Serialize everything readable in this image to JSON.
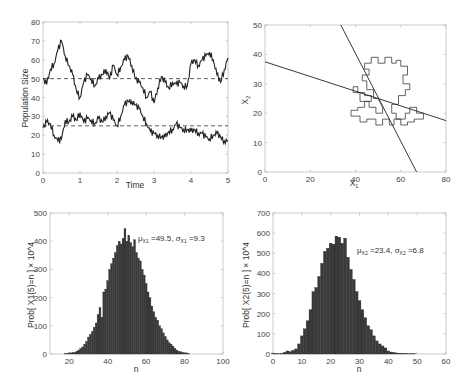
{
  "chart_data": [
    {
      "type": "line",
      "panel": "top-left",
      "title": "",
      "xlabel": "Time",
      "ylabel": "Population Size",
      "xlim": [
        0,
        5
      ],
      "ylim": [
        0,
        80
      ],
      "xticks": [
        "0",
        "1",
        "2",
        "3",
        "4",
        "5"
      ],
      "yticks": [
        "0",
        "10",
        "20",
        "30",
        "40",
        "50",
        "60",
        "70",
        "80"
      ],
      "series": [
        {
          "name": "X1 trajectory",
          "style": "solid",
          "x": [
            0,
            0.1,
            0.2,
            0.3,
            0.4,
            0.5,
            0.6,
            0.7,
            0.8,
            0.9,
            1.0,
            1.1,
            1.2,
            1.3,
            1.4,
            1.5,
            1.6,
            1.7,
            1.8,
            1.9,
            2.0,
            2.1,
            2.2,
            2.3,
            2.4,
            2.5,
            2.6,
            2.7,
            2.8,
            2.9,
            3.0,
            3.1,
            3.2,
            3.3,
            3.4,
            3.5,
            3.6,
            3.7,
            3.8,
            3.9,
            4.0,
            4.1,
            4.2,
            4.3,
            4.4,
            4.5,
            4.6,
            4.7,
            4.8,
            4.9,
            5.0
          ],
          "values": [
            50,
            47,
            55,
            58,
            65,
            70,
            62,
            57,
            52,
            44,
            40,
            48,
            52,
            50,
            46,
            50,
            52,
            55,
            50,
            57,
            52,
            56,
            60,
            62,
            57,
            50,
            48,
            45,
            40,
            43,
            37,
            45,
            51,
            48,
            45,
            48,
            47,
            48,
            46,
            46,
            58,
            60,
            57,
            60,
            62,
            64,
            60,
            52,
            48,
            55,
            61
          ]
        },
        {
          "name": "X2 trajectory",
          "style": "solid",
          "x": [
            0,
            0.1,
            0.2,
            0.3,
            0.4,
            0.5,
            0.6,
            0.7,
            0.8,
            0.9,
            1.0,
            1.1,
            1.2,
            1.3,
            1.4,
            1.5,
            1.6,
            1.7,
            1.8,
            1.9,
            2.0,
            2.1,
            2.2,
            2.3,
            2.4,
            2.5,
            2.6,
            2.7,
            2.8,
            2.9,
            3.0,
            3.1,
            3.2,
            3.3,
            3.4,
            3.5,
            3.6,
            3.7,
            3.8,
            3.9,
            4.0,
            4.1,
            4.2,
            4.3,
            4.4,
            4.5,
            4.6,
            4.7,
            4.8,
            4.9,
            5.0
          ],
          "values": [
            24,
            27,
            26,
            20,
            17,
            18,
            28,
            27,
            30,
            28,
            32,
            27,
            29,
            28,
            26,
            29,
            27,
            30,
            32,
            28,
            25,
            30,
            36,
            38,
            38,
            36,
            34,
            30,
            26,
            22,
            21,
            20,
            19,
            19,
            22,
            23,
            26,
            24,
            23,
            23,
            22,
            23,
            21,
            21,
            19,
            18,
            20,
            21,
            19,
            17,
            17
          ]
        },
        {
          "name": "X1 equilibrium",
          "style": "dashed",
          "x": [
            0,
            5
          ],
          "values": [
            50,
            50
          ]
        },
        {
          "name": "X2 equilibrium",
          "style": "dashed",
          "x": [
            0,
            5
          ],
          "values": [
            25,
            25
          ]
        }
      ]
    },
    {
      "type": "line",
      "panel": "top-right",
      "title": "",
      "xlabel": "X1",
      "ylabel": "X2",
      "xlim": [
        0,
        80
      ],
      "ylim": [
        0,
        50
      ],
      "xticks": [
        "0",
        "20",
        "40",
        "60",
        "80"
      ],
      "yticks": [
        "0",
        "10",
        "20",
        "30",
        "40",
        "50"
      ],
      "series": [
        {
          "name": "nullcline 1",
          "style": "solid",
          "x": [
            0,
            80
          ],
          "values": [
            37.5,
            17.5
          ]
        },
        {
          "name": "nullcline 2",
          "style": "solid",
          "x": [
            33.5,
            67
          ],
          "values": [
            50,
            0
          ]
        },
        {
          "name": "phase-plane random walk",
          "style": "staircase",
          "x": [
            50,
            48,
            48,
            45,
            45,
            43,
            43,
            46,
            46,
            44,
            44,
            47,
            47,
            50,
            50,
            53,
            53,
            56,
            56,
            58,
            58,
            60,
            60,
            63,
            63,
            61,
            61,
            64,
            64,
            62,
            62,
            59,
            59,
            56,
            56,
            58,
            58,
            62,
            62,
            64,
            64,
            67,
            67,
            70,
            70,
            66,
            66,
            63,
            63,
            60,
            60,
            57,
            57,
            55,
            55,
            52,
            52,
            49,
            49,
            45,
            45,
            42,
            42,
            38,
            38,
            41,
            41,
            44,
            44,
            47,
            47,
            44,
            44,
            41,
            41,
            39,
            39,
            42,
            42,
            46,
            46,
            49,
            49,
            52,
            52,
            50
          ],
          "values": [
            25,
            25,
            28,
            28,
            31,
            31,
            33,
            33,
            35,
            35,
            37,
            37,
            39,
            39,
            37,
            37,
            39,
            39,
            37,
            37,
            38,
            38,
            36,
            36,
            33,
            33,
            30,
            30,
            28,
            28,
            26,
            26,
            23,
            23,
            20,
            20,
            18,
            18,
            20,
            20,
            22,
            22,
            20,
            20,
            18,
            18,
            17,
            17,
            16,
            16,
            18,
            18,
            16,
            16,
            18,
            18,
            16,
            16,
            18,
            18,
            17,
            17,
            19,
            19,
            21,
            21,
            22,
            22,
            24,
            24,
            26,
            26,
            27,
            27,
            29,
            29,
            27,
            27,
            24,
            24,
            22,
            22,
            20,
            20,
            22,
            25
          ]
        }
      ]
    },
    {
      "type": "bar",
      "panel": "bottom-left",
      "title": "",
      "xlabel": "n",
      "ylabel": "Prob[ X1(5)=n ] × 10^4",
      "xlim": [
        10,
        100
      ],
      "ylim": [
        0,
        500
      ],
      "xticks": [
        "20",
        "40",
        "60",
        "80",
        "100"
      ],
      "yticks": [
        "0",
        "100",
        "200",
        "300",
        "400",
        "500"
      ],
      "annotation": "μX1=49.5, σX1=9.3",
      "categories": [
        18,
        20,
        22,
        24,
        25,
        26,
        27,
        28,
        29,
        30,
        31,
        32,
        33,
        34,
        35,
        36,
        37,
        38,
        39,
        40,
        41,
        42,
        43,
        44,
        45,
        46,
        47,
        48,
        49,
        50,
        51,
        52,
        53,
        54,
        55,
        56,
        57,
        58,
        59,
        60,
        61,
        62,
        63,
        64,
        65,
        66,
        67,
        68,
        69,
        70,
        71,
        72,
        73,
        74,
        75,
        76,
        77,
        78,
        79,
        80,
        82
      ],
      "values": [
        2,
        4,
        6,
        10,
        14,
        20,
        25,
        35,
        45,
        60,
        70,
        80,
        95,
        110,
        140,
        165,
        130,
        220,
        230,
        260,
        300,
        320,
        340,
        360,
        385,
        400,
        390,
        410,
        445,
        400,
        420,
        395,
        380,
        405,
        360,
        340,
        330,
        300,
        280,
        250,
        220,
        200,
        170,
        150,
        130,
        120,
        100,
        90,
        75,
        62,
        50,
        40,
        35,
        28,
        20,
        14,
        10,
        8,
        6,
        4,
        2
      ]
    },
    {
      "type": "bar",
      "panel": "bottom-right",
      "title": "",
      "xlabel": "n",
      "ylabel": "Prob[ X2(5)=n ] × 10^4",
      "xlim": [
        0,
        60
      ],
      "ylim": [
        0,
        700
      ],
      "xticks": [
        "0",
        "10",
        "20",
        "30",
        "40",
        "50",
        "60"
      ],
      "yticks": [
        "0",
        "100",
        "200",
        "300",
        "400",
        "500",
        "600",
        "700"
      ],
      "annotation": "μX2=23.4, σX2=6.8",
      "categories": [
        0,
        1,
        2,
        3,
        4,
        5,
        6,
        7,
        8,
        9,
        10,
        11,
        12,
        13,
        14,
        15,
        16,
        17,
        18,
        19,
        20,
        21,
        22,
        23,
        24,
        25,
        26,
        27,
        28,
        29,
        30,
        31,
        32,
        33,
        34,
        35,
        36,
        37,
        38,
        39,
        40,
        41,
        42,
        43,
        44,
        45,
        46,
        47,
        48,
        49,
        50
      ],
      "values": [
        3,
        2,
        1,
        3,
        8,
        15,
        12,
        18,
        25,
        50,
        90,
        125,
        165,
        220,
        310,
        330,
        385,
        450,
        510,
        525,
        550,
        545,
        585,
        580,
        550,
        575,
        480,
        420,
        370,
        310,
        265,
        220,
        180,
        140,
        120,
        90,
        65,
        50,
        40,
        30,
        15,
        10,
        8,
        5,
        4,
        3,
        2,
        1,
        1,
        1,
        0
      ]
    }
  ],
  "panels": {
    "tl": {
      "xlabel": "Time",
      "ylabel": "Population Size"
    },
    "tr": {
      "xlabel": "X",
      "xlabel_sub": "1",
      "ylabel": "X",
      "ylabel_sub": "2"
    },
    "bl": {
      "xlabel": "n",
      "ylabel": "Prob[ X1(5)=n ] × 10^4",
      "ann_mu": "49.5",
      "ann_sigma": "9.3",
      "ann_sub": "X1"
    },
    "br": {
      "xlabel": "n",
      "ylabel": "Prob[ X2(5)=n ] × 10^4",
      "ann_mu": "23.4",
      "ann_sigma": "6.8",
      "ann_sub": "X2"
    }
  },
  "colors": {
    "line": "#222222",
    "bar": "#3a3a3a",
    "axis": "#bfbfbf",
    "tick_text": "#444444"
  }
}
